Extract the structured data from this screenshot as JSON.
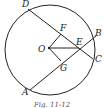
{
  "diagram": {
    "type": "geometry-circle-chords",
    "circle": {
      "center_label": "O"
    },
    "points": {
      "D": "D",
      "F": "F",
      "E": "E",
      "B": "B",
      "O": "O",
      "C": "C",
      "G": "G",
      "A": "A"
    },
    "segments": [
      "DC",
      "AB",
      "OF",
      "OG",
      "OE"
    ],
    "caption": "Fig. 11-12"
  }
}
